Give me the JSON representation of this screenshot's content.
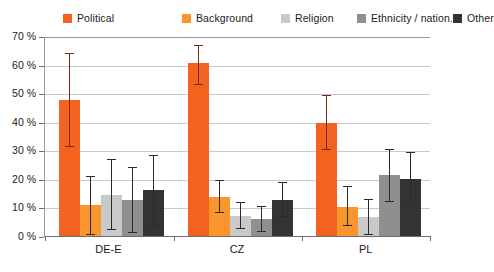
{
  "chart_data": {
    "type": "bar",
    "title": "",
    "subtitle": "",
    "xlabel": "",
    "ylabel": "",
    "categories": [
      "DE-E",
      "CZ",
      "PL"
    ],
    "ylim": [
      0,
      70
    ],
    "ytick_values": [
      0,
      10,
      20,
      30,
      40,
      50,
      60,
      70
    ],
    "ytick_labels": [
      "0 %",
      "10 %",
      "20 %",
      "30 %",
      "40 %",
      "50 %",
      "60 %",
      "70 %"
    ],
    "grid": true,
    "legend_position": "top",
    "value_unit": "%",
    "error_bars": "asymmetric confidence interval",
    "series": [
      {
        "name": "Political",
        "color": "#F4621F",
        "values": [
          47.5,
          60.5,
          39.5
        ],
        "err_low": [
          31.0,
          53.0,
          30.0
        ],
        "err_high": [
          64.0,
          67.0,
          49.5
        ]
      },
      {
        "name": "Background",
        "color": "#F9972E",
        "values": [
          11.0,
          13.5,
          10.0
        ],
        "err_low": [
          0.5,
          8.0,
          3.5
        ],
        "err_high": [
          21.0,
          19.5,
          17.5
        ]
      },
      {
        "name": "Religion",
        "color": "#C9C9C9",
        "values": [
          14.5,
          7.0,
          6.5
        ],
        "err_low": [
          2.0,
          2.5,
          0.5
        ],
        "err_high": [
          27.0,
          12.0,
          13.0
        ]
      },
      {
        "name": "Ethnicity / nation.",
        "color": "#8F8F8F",
        "values": [
          12.5,
          6.0,
          21.5
        ],
        "err_low": [
          1.0,
          1.5,
          12.0
        ],
        "err_high": [
          24.0,
          10.5,
          30.5
        ]
      },
      {
        "name": "Other",
        "color": "#333333",
        "values": [
          16.0,
          12.5,
          20.0
        ],
        "err_low": [
          4.0,
          6.5,
          10.0
        ],
        "err_high": [
          28.5,
          19.0,
          29.5
        ]
      }
    ]
  },
  "legend": {
    "items": [
      {
        "label": "Political",
        "color": "#F4621F"
      },
      {
        "label": "Background",
        "color": "#F9972E"
      },
      {
        "label": "Religion",
        "color": "#C9C9C9"
      },
      {
        "label": "Ethnicity / nation.",
        "color": "#8F8F8F"
      },
      {
        "label": "Other",
        "color": "#333333"
      }
    ]
  },
  "axis": {
    "y_labels": [
      "70 %",
      "60 %",
      "50 %",
      "40 %",
      "30 %",
      "20 %",
      "10 %",
      "0 %"
    ],
    "x_labels": [
      "DE-E",
      "CZ",
      "PL"
    ]
  }
}
